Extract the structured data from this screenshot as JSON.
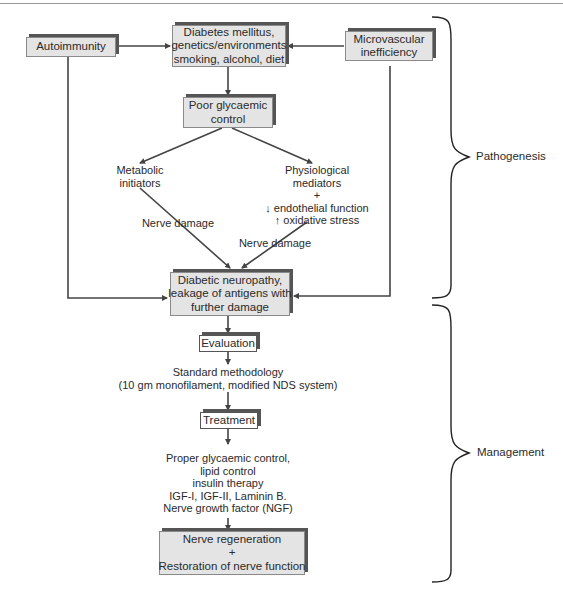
{
  "diagram": {
    "nodes": {
      "autoimmunity": {
        "lines": [
          "Autoimmunity"
        ]
      },
      "diabetes": {
        "lines": [
          "Diabetes mellitus,",
          "genetics/environments",
          "smoking, alcohol, diet"
        ]
      },
      "microvascular": {
        "lines": [
          "Microvascular",
          "inefficiency"
        ]
      },
      "poor_control": {
        "lines": [
          "Poor glycaemic",
          "control"
        ]
      },
      "metabolic": {
        "lines": [
          "Metabolic",
          "initiators"
        ]
      },
      "physiological": {
        "lines": [
          "Physiological",
          "mediators",
          "+",
          "↓ endothelial function",
          "↑ oxidative stress"
        ]
      },
      "nerve_damage_left": {
        "lines": [
          "Nerve damage"
        ]
      },
      "nerve_damage_right": {
        "lines": [
          "Nerve damage"
        ]
      },
      "neuropathy": {
        "lines": [
          "Diabetic neuropathy,",
          "leakage of antigens with",
          "further damage"
        ]
      },
      "evaluation": {
        "lines": [
          "Evaluation"
        ]
      },
      "methodology": {
        "lines": [
          "Standard methodology",
          "(10 gm monofilament, modified NDS system)"
        ]
      },
      "treatment": {
        "lines": [
          "Treatment"
        ]
      },
      "treatment_list": {
        "lines": [
          "Proper glycaemic control,",
          "lipid control",
          "insulin therapy",
          "IGF-I, IGF-II, Laminin B.",
          "Nerve growth factor (NGF)"
        ]
      },
      "regeneration": {
        "lines": [
          "Nerve regeneration",
          "+",
          "Restoration of nerve function"
        ]
      }
    },
    "brackets": {
      "pathogenesis": "Pathogenesis",
      "management": "Management"
    },
    "colors": {
      "box_fill": "#e4e4e4",
      "box_shadow": "#555555",
      "line": "#444444"
    }
  }
}
